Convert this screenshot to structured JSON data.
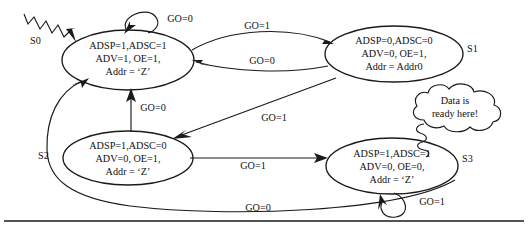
{
  "diagram": {
    "stroke_color": "#1a1a1a",
    "background_color": "#ffffff",
    "states": [
      {
        "id": "S0",
        "name": "S0",
        "lines": [
          "ADSP=1,ADSC=1",
          "ADV=1, OE=1,",
          "Addr = ‘Z’"
        ]
      },
      {
        "id": "S1",
        "name": "S1",
        "lines": [
          "ADSP=0,ADSC=0",
          "ADV=0, OE=1,",
          "Addr = Addr0"
        ]
      },
      {
        "id": "S2",
        "name": "S2",
        "lines": [
          "ADSP=1,ADSC=0",
          "ADV=0, OE=1,",
          "Addr = ‘Z’"
        ]
      },
      {
        "id": "S3",
        "name": "S3",
        "lines": [
          "ADSP=1,ADSC=1",
          "ADV=0, OE=0,",
          "Addr = ‘Z’"
        ]
      }
    ],
    "transitions": [
      {
        "id": "s0-self",
        "from": "S0",
        "to": "S0",
        "label": "GO=0"
      },
      {
        "id": "s0-s1",
        "from": "S0",
        "to": "S1",
        "label": "GO=1"
      },
      {
        "id": "s1-s0",
        "from": "S1",
        "to": "S0",
        "label": "GO=0"
      },
      {
        "id": "s1-s2",
        "from": "S1",
        "to": "S2",
        "label": "GO=1"
      },
      {
        "id": "s2-s0",
        "from": "S2",
        "to": "S0",
        "label": "GO=0"
      },
      {
        "id": "s2-s3",
        "from": "S2",
        "to": "S3",
        "label": "GO=1"
      },
      {
        "id": "s3-self",
        "from": "S3",
        "to": "S3",
        "label": "GO=1"
      },
      {
        "id": "s3-s0",
        "from": "S3",
        "to": "S0",
        "label": "GO=0"
      }
    ],
    "annotation": {
      "id": "data-ready-callout",
      "lines": [
        "Data is",
        "ready here!"
      ],
      "points_to": "S3"
    },
    "reset_arrow": {
      "id": "reset-squiggle",
      "points_to": "S0"
    }
  }
}
